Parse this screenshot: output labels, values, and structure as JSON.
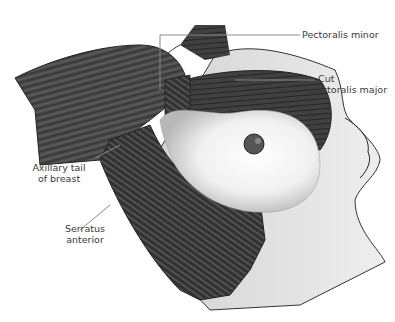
{
  "figure": {
    "colors": {
      "background": "#ffffff",
      "muscle_dark": "#3c3c3c",
      "muscle_mid": "#6a6a6a",
      "skin": "#e6e6e6",
      "breast_tissue": "#f4f4f4",
      "leader_line": "#8a8a8a",
      "label_text": "#3a3a3a"
    }
  },
  "labels": {
    "pectoralis_minor": "Pectoralis minor",
    "cut_pectoralis_major_line1": "Cut",
    "cut_pectoralis_major_line2": "pectoralis major",
    "axillary_tail_line1": "Axillary tail",
    "axillary_tail_line2": "of breast",
    "serratus_line1": "Serratus",
    "serratus_line2": "anterior"
  }
}
